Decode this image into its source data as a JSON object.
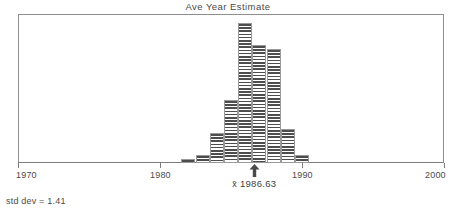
{
  "chart_data": {
    "type": "bar",
    "title": "Ave Year Estimate",
    "xlabel": "",
    "ylabel": "",
    "grid": false,
    "legend": "none",
    "xlim": [
      1970,
      2000
    ],
    "ylim": [
      0,
      35
    ],
    "axis_ticks": [
      {
        "value": 1970,
        "label": "1970"
      },
      {
        "value": 1980,
        "label": "1980"
      },
      {
        "value": 1990,
        "label": "1990"
      },
      {
        "value": 2000,
        "label": "2000"
      }
    ],
    "categories": [
      1982,
      1983,
      1984,
      1985,
      1986,
      1987,
      1988,
      1989,
      1990
    ],
    "values": [
      1,
      2,
      7,
      15,
      33,
      28,
      27,
      8,
      2
    ],
    "bar_width_years": 1,
    "annotations": [
      {
        "name": "mean-marker",
        "value": 1986.63,
        "label": "1986.63",
        "symbol": "x̄"
      },
      {
        "name": "std-dev",
        "text": "std dev = 1.41"
      }
    ]
  },
  "chart": {
    "title": "Ave Year Estimate",
    "mean_symbol": "x̄",
    "mean_value": "1986.63",
    "std_dev_text": "std dev = 1.41"
  },
  "colors": {
    "axis": "#7d7d7d",
    "frame": "#8e8e8e",
    "bar_hatch": "#4d4d4d",
    "bar_outline": "#9a9a9a",
    "text": "#4b4b4b",
    "background": "#ffffff"
  }
}
